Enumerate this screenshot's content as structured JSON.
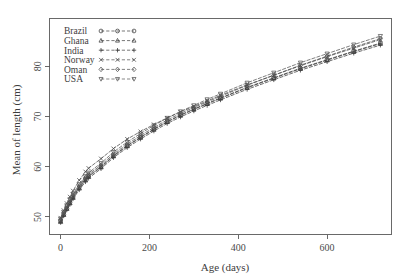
{
  "chart_data": {
    "type": "line",
    "title": "",
    "xlabel": "Age (days)",
    "ylabel": "Mean of length (cm)",
    "xlim": [
      -25,
      745
    ],
    "ylim": [
      46.5,
      89.5
    ],
    "xticks": [
      0,
      200,
      400,
      600
    ],
    "yticks": [
      50,
      60,
      70,
      80
    ],
    "grid": false,
    "legend_position": "top-left",
    "x": [
      0,
      7,
      14,
      21,
      28,
      42,
      56,
      63,
      91,
      119,
      150,
      180,
      210,
      240,
      270,
      300,
      330,
      360,
      420,
      480,
      540,
      600,
      660,
      720
    ],
    "series": [
      {
        "name": "Brazil",
        "marker": "circle",
        "color": "#3c3c3c",
        "values": [
          49.2,
          50.5,
          51.7,
          52.9,
          54.0,
          55.9,
          57.5,
          58.2,
          60.0,
          62.2,
          64.2,
          65.9,
          67.5,
          69.0,
          70.3,
          71.5,
          72.6,
          73.7,
          75.8,
          77.7,
          79.6,
          81.3,
          83.0,
          84.6
        ]
      },
      {
        "name": "Ghana",
        "marker": "triangle-up",
        "color": "#3c3c3c",
        "values": [
          49.0,
          50.4,
          51.6,
          52.7,
          53.8,
          55.7,
          57.3,
          58.0,
          59.9,
          62.1,
          64.1,
          65.8,
          67.4,
          68.9,
          70.2,
          71.4,
          72.5,
          73.6,
          75.7,
          77.6,
          79.5,
          81.2,
          82.9,
          84.5
        ]
      },
      {
        "name": "India",
        "marker": "plus",
        "color": "#3c3c3c",
        "values": [
          48.9,
          50.2,
          51.4,
          52.5,
          53.6,
          55.4,
          57.0,
          57.7,
          59.6,
          61.8,
          63.8,
          65.5,
          67.1,
          68.6,
          69.9,
          71.1,
          72.2,
          73.3,
          75.4,
          77.3,
          79.2,
          80.9,
          82.6,
          84.2
        ]
      },
      {
        "name": "Norway",
        "marker": "cross",
        "color": "#4a4a4a",
        "values": [
          49.8,
          51.3,
          52.7,
          54.0,
          55.2,
          57.3,
          59.0,
          59.7,
          61.6,
          63.6,
          65.5,
          67.0,
          68.4,
          69.7,
          70.9,
          72.0,
          73.1,
          74.2,
          76.3,
          78.2,
          80.1,
          81.9,
          83.6,
          85.3
        ]
      },
      {
        "name": "Oman",
        "marker": "diamond",
        "color": "#4a4a4a",
        "values": [
          49.4,
          50.8,
          52.0,
          53.2,
          54.3,
          56.2,
          57.8,
          58.5,
          60.3,
          62.5,
          64.5,
          66.2,
          67.8,
          69.3,
          70.6,
          71.8,
          72.9,
          74.0,
          76.2,
          78.2,
          80.2,
          82.0,
          83.8,
          85.5
        ]
      },
      {
        "name": "USA",
        "marker": "triangle-down",
        "color": "#555555",
        "values": [
          49.6,
          51.0,
          52.3,
          53.5,
          54.6,
          56.5,
          58.1,
          58.8,
          60.7,
          62.9,
          64.9,
          66.6,
          68.2,
          69.7,
          71.0,
          72.2,
          73.4,
          74.5,
          76.7,
          78.7,
          80.7,
          82.5,
          84.3,
          86.0
        ]
      }
    ]
  },
  "legend": {
    "entries": [
      {
        "label": "Brazil",
        "marker": "circle"
      },
      {
        "label": "Ghana",
        "marker": "triangle-up"
      },
      {
        "label": "India",
        "marker": "plus"
      },
      {
        "label": "Norway",
        "marker": "cross"
      },
      {
        "label": "Oman",
        "marker": "diamond"
      },
      {
        "label": "USA",
        "marker": "triangle-down"
      }
    ]
  },
  "colors": {
    "background": "#ffffff",
    "axis": "#595959",
    "text": "#3d3d3d",
    "series_default": "#3c3c3c"
  }
}
